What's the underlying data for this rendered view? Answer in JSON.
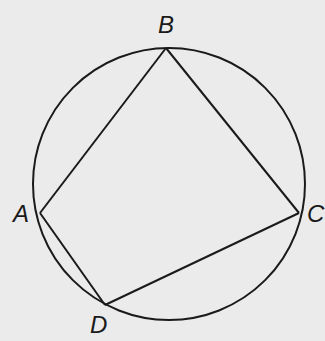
{
  "diagram": {
    "type": "cyclic-quadrilateral",
    "circle": {
      "cx": 169,
      "cy": 184,
      "r": 136
    },
    "stroke_color": "#1a1a1a",
    "background_color": "#ebebeb",
    "points": {
      "A": {
        "label": "A",
        "x": 40,
        "y": 213
      },
      "B": {
        "label": "B",
        "x": 166,
        "y": 48
      },
      "C": {
        "label": "C",
        "x": 299,
        "y": 213
      },
      "D": {
        "label": "D",
        "x": 105,
        "y": 305
      }
    },
    "segments": [
      "AB",
      "BC",
      "CD",
      "DA"
    ],
    "labels": {
      "A": "A",
      "B": "B",
      "C": "C",
      "D": "D"
    }
  }
}
